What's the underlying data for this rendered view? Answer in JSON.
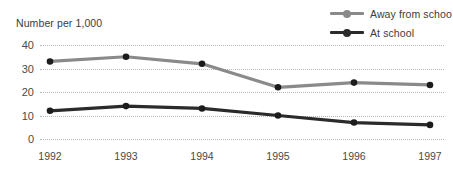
{
  "chart_data": {
    "type": "line",
    "title": "",
    "subtitle": "",
    "xlabel": "",
    "ylabel": "Number per 1,000",
    "categories": [
      "1992",
      "1993",
      "1994",
      "1995",
      "1996",
      "1997"
    ],
    "x": [
      1992,
      1993,
      1994,
      1995,
      1996,
      1997
    ],
    "ylim": [
      0,
      40
    ],
    "yticks": [
      0,
      10,
      20,
      30,
      40
    ],
    "ytick_labels": [
      "0",
      "10",
      "20",
      "30",
      "40"
    ],
    "grid": true,
    "grid_style": "dotted-horizontal",
    "legend_position": "top-right",
    "series": [
      {
        "name": "Away from schoo",
        "color": "#8a8a8a",
        "values": [
          33,
          35,
          32,
          22,
          24,
          23
        ]
      },
      {
        "name": "At school",
        "color": "#2b2b2b",
        "values": [
          12,
          14,
          13,
          10,
          7,
          6
        ]
      }
    ]
  },
  "legend": {
    "items": [
      {
        "label": "Away from schoo",
        "swatch_icon": "line-marker-icon"
      },
      {
        "label": "At school",
        "swatch_icon": "line-marker-icon"
      }
    ]
  },
  "axis": {
    "y_title": "Number per 1,000"
  },
  "colors": {
    "series_away": "#8a8a8a",
    "series_at_school": "#2b2b2b",
    "gridline": "#b8b8b8",
    "text": "#3c3c3c",
    "background": "#ffffff"
  }
}
